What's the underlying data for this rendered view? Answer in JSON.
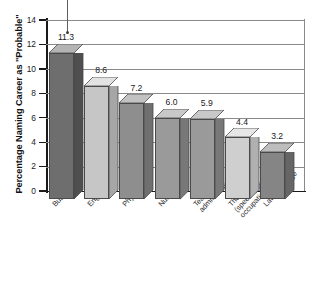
{
  "chart_data": {
    "type": "bar",
    "title": "",
    "xlabel": "",
    "ylabel": "Percentage Naming Career as \"Probable\"",
    "ylim": [
      0,
      14
    ],
    "ytick_values": [
      14,
      12,
      10,
      8,
      6,
      4,
      2,
      0
    ],
    "ytick_labels": [
      "14",
      "12",
      "10",
      "8",
      "6",
      "4",
      "2",
      "0"
    ],
    "grid": true,
    "legend": "none",
    "categories": [
      "Business",
      "Engineer",
      "Physician",
      "Nurse",
      "Teacher, administrator",
      "Therapist (speech, physical, occupational)",
      "Lawyer, judge"
    ],
    "category_lines": [
      [
        "Business"
      ],
      [
        "Engineer"
      ],
      [
        "Physician"
      ],
      [
        "Nurse"
      ],
      [
        "Teacher,",
        "administrator"
      ],
      [
        "Therapist",
        "(speech, physical,",
        "occupational)"
      ],
      [
        "Lawyer, judge"
      ]
    ],
    "values": [
      11.3,
      8.6,
      7.2,
      6.0,
      5.9,
      4.4,
      3.2
    ],
    "value_labels": [
      "11.3",
      "8.6",
      "7.2",
      "6.0",
      "5.9",
      "4.4",
      "3.2"
    ],
    "bar_colors": [
      "#6e6e6e",
      "#c6c6c6",
      "#8e8e8e",
      "#9a9a9a",
      "#9a9a9a",
      "#cfcfcf",
      "#858585"
    ],
    "bar_top_colors": [
      "#b4b4b4",
      "#e2e2e2",
      "#c2c2c2",
      "#c8c8c8",
      "#c8c8c8",
      "#e6e6e6",
      "#bdbdbd"
    ],
    "bar_side_colors": [
      "#4f4f4f",
      "#a6a6a6",
      "#6f6f6f",
      "#787878",
      "#787878",
      "#b0b0b0",
      "#666666"
    ]
  },
  "axis": {
    "grid_color": "#8a8a8a",
    "axis_color": "#1a1a1a"
  },
  "annotation": {
    "pointer_name": "vertical-pointer-line"
  }
}
